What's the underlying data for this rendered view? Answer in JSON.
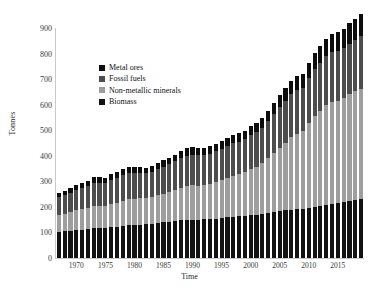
{
  "chart_data": {
    "type": "bar",
    "subtype": "stacked-bar",
    "title": "",
    "subtitle": "",
    "xlabel": "Time",
    "ylabel": "Tonnes",
    "ylim": [
      0,
      900
    ],
    "ytick_step": 100,
    "yticks": [
      0,
      100,
      200,
      300,
      400,
      500,
      600,
      700,
      800,
      900
    ],
    "grid": false,
    "legend_position": "upper-left-inside",
    "xtick_labels": [
      "1970",
      "1975",
      "1980",
      "1985",
      "1990",
      "1995",
      "2000",
      "2005",
      "2010",
      "2015"
    ],
    "xticks": [
      1970,
      1975,
      1980,
      1985,
      1990,
      1995,
      2000,
      2005,
      2010,
      2015
    ],
    "x": [
      1967,
      1968,
      1969,
      1970,
      1971,
      1972,
      1973,
      1974,
      1975,
      1976,
      1977,
      1978,
      1979,
      1980,
      1981,
      1982,
      1983,
      1984,
      1985,
      1986,
      1987,
      1988,
      1989,
      1990,
      1991,
      1992,
      1993,
      1994,
      1995,
      1996,
      1997,
      1998,
      1999,
      2000,
      2001,
      2002,
      2003,
      2004,
      2005,
      2006,
      2007,
      2008,
      2009,
      2010,
      2011,
      2012,
      2013,
      2014,
      2015,
      2016,
      2017,
      2018,
      2019
    ],
    "stack_order_bottom_to_top": [
      "Biomass",
      "Non-metallic minerals",
      "Fossil fuels",
      "Metal ores"
    ],
    "series": [
      {
        "name": "Biomass",
        "color": "#121212",
        "values": [
          102,
          104,
          106,
          109,
          111,
          113,
          116,
          117,
          118,
          121,
          123,
          126,
          128,
          129,
          131,
          132,
          134,
          137,
          139,
          141,
          144,
          147,
          149,
          150,
          150,
          151,
          152,
          154,
          156,
          159,
          161,
          163,
          165,
          168,
          170,
          173,
          176,
          180,
          183,
          186,
          189,
          191,
          192,
          196,
          200,
          203,
          207,
          211,
          214,
          218,
          223,
          228,
          232
        ]
      },
      {
        "name": "Non-metallic minerals",
        "color": "#9e9e9e",
        "values": [
          66,
          69,
          73,
          77,
          79,
          83,
          88,
          87,
          86,
          91,
          94,
          99,
          103,
          103,
          102,
          101,
          104,
          108,
          112,
          116,
          122,
          128,
          132,
          134,
          133,
          134,
          137,
          142,
          148,
          154,
          160,
          165,
          172,
          179,
          187,
          198,
          214,
          231,
          248,
          266,
          283,
          293,
          305,
          332,
          357,
          372,
          390,
          401,
          402,
          408,
          418,
          424,
          430
        ]
      },
      {
        "name": "Fossil fuels",
        "color": "#4d4d4d",
        "values": [
          70,
          73,
          77,
          81,
          83,
          87,
          91,
          91,
          90,
          94,
          97,
          99,
          103,
          101,
          99,
          98,
          99,
          103,
          106,
          109,
          112,
          116,
          119,
          120,
          119,
          119,
          120,
          121,
          123,
          126,
          128,
          128,
          129,
          133,
          135,
          138,
          145,
          152,
          158,
          163,
          169,
          172,
          170,
          177,
          184,
          188,
          192,
          194,
          194,
          194,
          198,
          203,
          206
        ]
      },
      {
        "name": "Metal ores",
        "color": "#0d0d0d",
        "values": [
          16,
          17,
          18,
          19,
          19,
          20,
          21,
          21,
          20,
          22,
          22,
          23,
          24,
          24,
          23,
          22,
          23,
          24,
          25,
          26,
          27,
          28,
          29,
          29,
          28,
          28,
          28,
          29,
          30,
          31,
          32,
          32,
          33,
          35,
          36,
          38,
          41,
          44,
          47,
          50,
          53,
          55,
          54,
          59,
          63,
          66,
          69,
          72,
          74,
          76,
          79,
          82,
          85
        ]
      }
    ],
    "totals": [
      254,
      263,
      274,
      286,
      292,
      303,
      316,
      316,
      314,
      328,
      336,
      347,
      358,
      357,
      355,
      353,
      360,
      372,
      382,
      392,
      405,
      419,
      429,
      433,
      430,
      432,
      437,
      446,
      457,
      470,
      481,
      488,
      499,
      515,
      528,
      547,
      576,
      607,
      636,
      665,
      694,
      711,
      721,
      764,
      804,
      829,
      858,
      878,
      884,
      896,
      918,
      937,
      953
    ]
  },
  "legend": {
    "items": [
      {
        "label": "Metal ores",
        "color": "#0d0d0d"
      },
      {
        "label": "Fossil fuels",
        "color": "#4d4d4d"
      },
      {
        "label": "Non-metallic minerals",
        "color": "#9e9e9e"
      },
      {
        "label": "Biomass",
        "color": "#121212"
      }
    ]
  },
  "axes": {
    "y_title": "Tonnes",
    "x_title": "Time"
  }
}
